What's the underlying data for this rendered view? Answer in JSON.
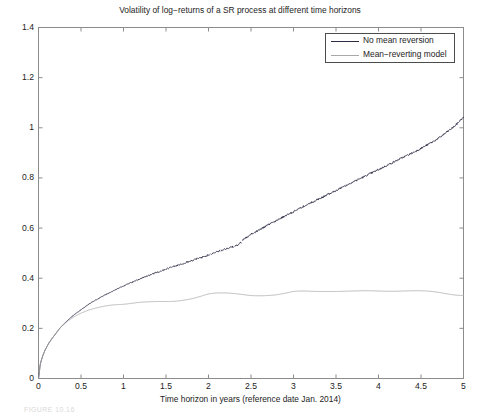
{
  "chart_data": {
    "type": "line",
    "title": "Volatility of log−returns of a SR process at different time horizons",
    "xlabel": "Time horizon in years (reference date Jan. 2014)",
    "ylabel": "",
    "xlim": [
      0,
      5
    ],
    "ylim": [
      0,
      1.4
    ],
    "grid": false,
    "legend_position": "top-right-inside",
    "xticks": [
      0,
      0.5,
      1,
      1.5,
      2,
      2.5,
      3,
      3.5,
      4,
      4.5,
      5
    ],
    "xtick_labels": [
      "0",
      "0.5",
      "1",
      "1.5",
      "2",
      "2.5",
      "3",
      "3.5",
      "4",
      "4.5",
      "5"
    ],
    "yticks": [
      0,
      0.2,
      0.4,
      0.6,
      0.8,
      1,
      1.2,
      1.4
    ],
    "ytick_labels": [
      "0",
      "0.2",
      "0.4",
      "0.6",
      "0.8",
      "1",
      "1.2",
      "1.4"
    ],
    "series": [
      {
        "name": "No mean reversion",
        "color": "#2b2b44",
        "x": [
          0,
          0.02,
          0.05,
          0.08,
          0.12,
          0.16,
          0.2,
          0.25,
          0.3,
          0.35,
          0.4,
          0.45,
          0.5,
          0.6,
          0.7,
          0.8,
          0.9,
          1.0,
          1.1,
          1.2,
          1.3,
          1.4,
          1.5,
          1.6,
          1.7,
          1.8,
          1.9,
          2.0,
          2.06,
          2.12,
          2.2,
          2.28,
          2.36,
          2.42,
          2.5,
          2.6,
          2.7,
          2.8,
          2.9,
          3.0,
          3.1,
          3.2,
          3.3,
          3.4,
          3.5,
          3.6,
          3.7,
          3.8,
          3.9,
          4.0,
          4.1,
          4.2,
          4.3,
          4.4,
          4.5,
          4.6,
          4.7,
          4.8,
          4.9,
          5.0
        ],
        "y": [
          0.0,
          0.055,
          0.09,
          0.115,
          0.14,
          0.16,
          0.178,
          0.2,
          0.218,
          0.234,
          0.249,
          0.262,
          0.275,
          0.298,
          0.318,
          0.336,
          0.353,
          0.369,
          0.384,
          0.398,
          0.411,
          0.424,
          0.436,
          0.448,
          0.459,
          0.47,
          0.481,
          0.492,
          0.5,
          0.508,
          0.516,
          0.525,
          0.536,
          0.556,
          0.575,
          0.593,
          0.612,
          0.63,
          0.648,
          0.665,
          0.683,
          0.7,
          0.716,
          0.733,
          0.75,
          0.767,
          0.784,
          0.8,
          0.817,
          0.833,
          0.85,
          0.867,
          0.884,
          0.9,
          0.918,
          0.937,
          0.957,
          0.982,
          1.008,
          1.04
        ],
        "breaks": [
          2.02,
          2.14,
          2.3,
          2.39
        ]
      },
      {
        "name": "Mean−reverting model",
        "color": "#a8a8a8",
        "x": [
          0,
          0.02,
          0.05,
          0.08,
          0.12,
          0.16,
          0.2,
          0.25,
          0.3,
          0.35,
          0.4,
          0.45,
          0.5,
          0.6,
          0.7,
          0.8,
          0.9,
          1.0,
          1.1,
          1.2,
          1.3,
          1.4,
          1.5,
          1.6,
          1.7,
          1.8,
          1.9,
          2.0,
          2.1,
          2.2,
          2.3,
          2.4,
          2.5,
          2.6,
          2.7,
          2.8,
          2.9,
          3.0,
          3.1,
          3.2,
          3.3,
          3.4,
          3.5,
          3.6,
          3.7,
          3.8,
          3.9,
          4.0,
          4.1,
          4.2,
          4.3,
          4.4,
          4.5,
          4.6,
          4.7,
          4.8,
          4.9,
          5.0
        ],
        "y": [
          0.0,
          0.055,
          0.09,
          0.115,
          0.14,
          0.16,
          0.178,
          0.2,
          0.216,
          0.23,
          0.242,
          0.252,
          0.261,
          0.274,
          0.283,
          0.29,
          0.294,
          0.296,
          0.3,
          0.304,
          0.306,
          0.307,
          0.307,
          0.308,
          0.312,
          0.318,
          0.327,
          0.337,
          0.341,
          0.341,
          0.339,
          0.335,
          0.331,
          0.33,
          0.331,
          0.334,
          0.34,
          0.347,
          0.349,
          0.348,
          0.347,
          0.347,
          0.347,
          0.348,
          0.349,
          0.35,
          0.35,
          0.349,
          0.348,
          0.348,
          0.349,
          0.35,
          0.35,
          0.348,
          0.344,
          0.338,
          0.333,
          0.331
        ],
        "breaks": []
      }
    ]
  },
  "legend": {
    "items": [
      {
        "label": "No mean reversion"
      },
      {
        "label": "Mean−reverting model"
      }
    ]
  },
  "caption": {
    "fragment": "FIGURE 10.16"
  },
  "colors": {
    "series_no_mean_reversion": "#2b2b44",
    "series_mean_reverting": "#a8a8a8",
    "axis": "#8c8c8c",
    "text": "#1d1d1d",
    "background": "#ffffff"
  }
}
